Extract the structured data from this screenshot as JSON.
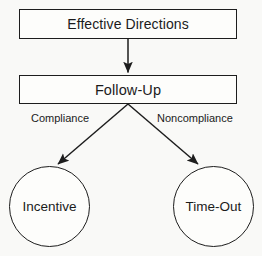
{
  "diagram": {
    "background_color": "#f9f9f7",
    "stroke_color": "#1d1d1d",
    "nodes": {
      "effective_directions": {
        "label": "Effective Directions",
        "shape": "rectangle"
      },
      "follow_up": {
        "label": "Follow-Up",
        "shape": "rectangle"
      },
      "incentive": {
        "label": "Incentive",
        "shape": "circle"
      },
      "time_out": {
        "label": "Time-Out",
        "shape": "circle"
      }
    },
    "edges": {
      "directions_to_followup": {
        "label": ""
      },
      "followup_to_incentive": {
        "label": "Compliance"
      },
      "followup_to_timeout": {
        "label": "Noncompliance"
      }
    }
  }
}
